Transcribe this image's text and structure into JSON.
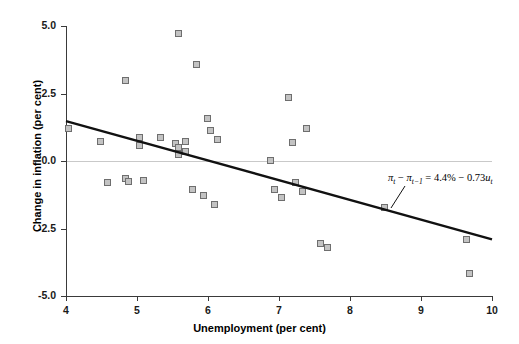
{
  "chart_data": {
    "type": "scatter",
    "title": "",
    "xlabel": "Unemployment (per cent)",
    "ylabel": "Change in inflation (per cent)",
    "xlim": [
      4,
      10
    ],
    "ylim": [
      -5.0,
      5.0
    ],
    "xticks": [
      "4",
      "5",
      "6",
      "7",
      "8",
      "9",
      "10"
    ],
    "yticks": [
      "5.0",
      "2.5",
      "0.0",
      "-2.5",
      "-5.0"
    ],
    "xtick_values": [
      4,
      5,
      6,
      7,
      8,
      9,
      10
    ],
    "ytick_values": [
      5.0,
      2.5,
      0.0,
      -2.5,
      -5.0
    ],
    "grid": false,
    "legend": false,
    "zero_line": true,
    "marker_fill": "#c3c3c3",
    "marker_edge": "#6e6e6e",
    "line_color": "#111111",
    "axis_color": "#3a3a3a",
    "points": [
      {
        "x": 4.05,
        "y": 1.15
      },
      {
        "x": 4.5,
        "y": 0.7
      },
      {
        "x": 4.6,
        "y": -0.85
      },
      {
        "x": 4.85,
        "y": -0.7
      },
      {
        "x": 4.9,
        "y": -0.8
      },
      {
        "x": 4.85,
        "y": 2.95
      },
      {
        "x": 5.05,
        "y": 0.55
      },
      {
        "x": 5.05,
        "y": 0.85
      },
      {
        "x": 5.1,
        "y": -0.75
      },
      {
        "x": 5.35,
        "y": 0.82
      },
      {
        "x": 5.55,
        "y": 0.6
      },
      {
        "x": 5.6,
        "y": 0.45
      },
      {
        "x": 5.6,
        "y": 0.2
      },
      {
        "x": 5.7,
        "y": 0.7
      },
      {
        "x": 5.7,
        "y": 0.3
      },
      {
        "x": 5.6,
        "y": 4.7
      },
      {
        "x": 5.85,
        "y": 3.55
      },
      {
        "x": 5.8,
        "y": -1.1
      },
      {
        "x": 5.95,
        "y": -1.3
      },
      {
        "x": 6.0,
        "y": 1.55
      },
      {
        "x": 6.05,
        "y": 1.1
      },
      {
        "x": 6.1,
        "y": -1.65
      },
      {
        "x": 6.15,
        "y": 0.75
      },
      {
        "x": 6.9,
        "y": 0.0
      },
      {
        "x": 6.95,
        "y": -1.1
      },
      {
        "x": 7.05,
        "y": -1.4
      },
      {
        "x": 7.15,
        "y": 2.3
      },
      {
        "x": 7.2,
        "y": 0.65
      },
      {
        "x": 7.25,
        "y": -0.85
      },
      {
        "x": 7.4,
        "y": 1.15
      },
      {
        "x": 7.35,
        "y": -1.15
      },
      {
        "x": 7.6,
        "y": -3.1
      },
      {
        "x": 7.7,
        "y": -3.25
      },
      {
        "x": 8.5,
        "y": -1.75
      },
      {
        "x": 9.65,
        "y": -2.95
      },
      {
        "x": 9.7,
        "y": -4.2
      }
    ],
    "regression": {
      "intercept": 4.4,
      "slope": -0.73,
      "x_start": 4.0,
      "x_end": 10.0,
      "equation_text": "πt − πt−1 = 4.4% − 0.73ut",
      "equation_parts": {
        "pi": "π",
        "t": "t",
        "t_minus_1": "t−1",
        "minus": " − ",
        "equals": " = ",
        "constant": "4.4%",
        "coef": " − 0.73",
        "u": "u"
      }
    }
  }
}
